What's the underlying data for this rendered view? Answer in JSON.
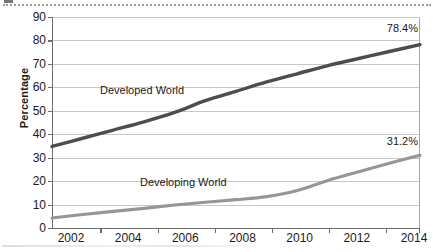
{
  "chart_data": {
    "type": "line",
    "title": "",
    "subtitle": "",
    "xlabel": "",
    "ylabel": "Percentage",
    "xlim": [
      2002,
      2014
    ],
    "ylim": [
      0,
      90
    ],
    "grid": true,
    "legend_position": "inline-annotations",
    "x": [
      2002,
      2003,
      2004,
      2005,
      2006,
      2007,
      2008,
      2009,
      2010,
      2011,
      2012,
      2013,
      2014
    ],
    "xticks": [
      "2002",
      "2004",
      "2006",
      "2008",
      "2010",
      "2012",
      "2014"
    ],
    "xtick_values": [
      2002,
      2004,
      2006,
      2008,
      2010,
      2012,
      2014
    ],
    "yticks": [
      "0",
      "10",
      "20",
      "30",
      "40",
      "50",
      "60",
      "70",
      "80",
      "90"
    ],
    "ytick_values": [
      0,
      10,
      20,
      30,
      40,
      50,
      60,
      70,
      80,
      90
    ],
    "series": [
      {
        "name": "Developed World",
        "color": "#4d4d4d",
        "values": [
          35.0,
          38.5,
          42.0,
          45.5,
          49.5,
          54.5,
          58.5,
          62.5,
          66.0,
          69.5,
          72.5,
          75.5,
          78.4
        ],
        "end_label": "78.4%"
      },
      {
        "name": "Developing World",
        "color": "#969696",
        "values": [
          4.5,
          6.0,
          7.3,
          8.6,
          10.0,
          11.2,
          12.3,
          13.6,
          16.2,
          20.5,
          24.2,
          27.8,
          31.2
        ],
        "end_label": "31.2%"
      }
    ],
    "annotations": [
      {
        "text": "Developed World",
        "series": "Developed World"
      },
      {
        "text": "Developing World",
        "series": "Developing World"
      },
      {
        "text": "78.4%",
        "series": "Developed World"
      },
      {
        "text": "31.2%",
        "series": "Developing World"
      }
    ]
  },
  "axes": {
    "y_title": "Percentage",
    "y_labels": [
      "90",
      "80",
      "70",
      "60",
      "50",
      "40",
      "30",
      "20",
      "10",
      "0"
    ],
    "x_labels": [
      "2002",
      "2004",
      "2006",
      "2008",
      "2010",
      "2012",
      "2014"
    ]
  },
  "labels": {
    "developed_series": "Developed World",
    "developing_series": "Developing World",
    "developed_value": "78.4%",
    "developing_value": "31.2%"
  },
  "colors": {
    "developed_line": "#4d4d4d",
    "developing_line": "#969696",
    "gridline": "#c8c8c8",
    "axis": "#6e6e6e",
    "background": "#ffffff",
    "text": "#1a1a1a"
  }
}
